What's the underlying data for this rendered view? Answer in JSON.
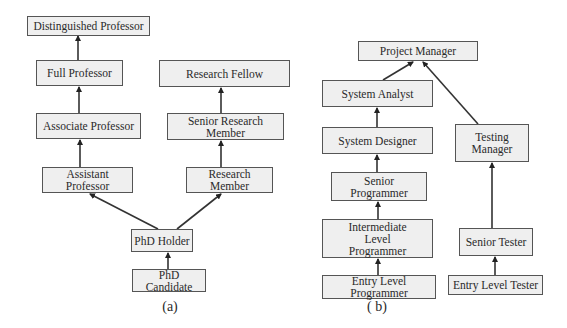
{
  "diagrams": [
    {
      "id": "a",
      "caption": "(a)",
      "nodes": {
        "distinguished_professor": "Distinguished Professor",
        "full_professor": "Full Professor",
        "associate_professor": "Associate Professor",
        "assistant_professor": "Assistant Professor",
        "research_fellow": "Research Fellow",
        "senior_research_member": "Senior Research Member",
        "research_member": "Research Member",
        "phd_holder": "PhD Holder",
        "phd_candidate": "PhD Candidate"
      },
      "edges": [
        [
          "PhD Candidate",
          "PhD Holder"
        ],
        [
          "PhD Holder",
          "Assistant Professor"
        ],
        [
          "PhD Holder",
          "Research Member"
        ],
        [
          "Assistant Professor",
          "Associate Professor"
        ],
        [
          "Associate Professor",
          "Full Professor"
        ],
        [
          "Full Professor",
          "Distinguished Professor"
        ],
        [
          "Research Member",
          "Senior Research Member"
        ],
        [
          "Senior Research Member",
          "Research Fellow"
        ]
      ]
    },
    {
      "id": "b",
      "caption": "( b)",
      "nodes": {
        "project_manager": "Project Manager",
        "system_analyst": "System Analyst",
        "system_designer": "System Designer",
        "senior_programmer": "Senior Programmer",
        "intermediate_level_programmer": "Intermediate Level Programmer",
        "entry_level_programmer": "Entry Level Programmer",
        "testing_manager": "Testing Manager",
        "senior_tester": "Senior Tester",
        "entry_level_tester": "Entry Level Tester"
      },
      "edges": [
        [
          "Entry Level Programmer",
          "Intermediate Level Programmer"
        ],
        [
          "Intermediate Level Programmer",
          "Senior Programmer"
        ],
        [
          "Senior Programmer",
          "System Designer"
        ],
        [
          "System Designer",
          "System Analyst"
        ],
        [
          "System Analyst",
          "Project Manager"
        ],
        [
          "Entry Level Tester",
          "Senior Tester"
        ],
        [
          "Senior Tester",
          "Testing Manager"
        ],
        [
          "Testing Manager",
          "Project Manager"
        ]
      ]
    }
  ]
}
